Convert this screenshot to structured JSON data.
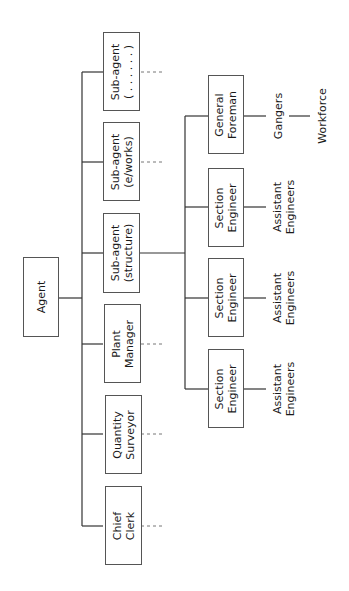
{
  "diagram": {
    "type": "organization-chart",
    "orientation": "rotated-90-ccw",
    "root": {
      "label": "Agent"
    },
    "level1": [
      {
        "line1": "Sub-agent",
        "line2": "( . . . . . . )",
        "has_dashed_continuation": true
      },
      {
        "line1": "Sub-agent",
        "line2": "(e/works)",
        "has_dashed_continuation": true
      },
      {
        "line1": "Sub-agent",
        "line2": "(structure)",
        "has_dashed_continuation": false
      },
      {
        "line1": "Plant",
        "line2": "Manager",
        "has_dashed_continuation": true
      },
      {
        "line1": "Quantity",
        "line2": "Surveyor",
        "has_dashed_continuation": true
      },
      {
        "line1": "Chief",
        "line2": "Clerk",
        "has_dashed_continuation": true
      }
    ],
    "level2_under_structure": [
      {
        "line1": "General",
        "line2": "Foreman",
        "sub": {
          "line1": "Gangers"
        },
        "subsub": {
          "line1": "Workforce"
        }
      },
      {
        "line1": "Section",
        "line2": "Engineer",
        "sub": {
          "line1": "Assistant",
          "line2": "Engineers"
        }
      },
      {
        "line1": "Section",
        "line2": "Engineer",
        "sub": {
          "line1": "Assistant",
          "line2": "Engineers"
        }
      },
      {
        "line1": "Section",
        "line2": "Engineer",
        "sub": {
          "line1": "Assistant",
          "line2": "Engineers"
        }
      }
    ]
  },
  "colors": {
    "line": "#333333",
    "dash": "#777777",
    "box_border": "#555555"
  }
}
